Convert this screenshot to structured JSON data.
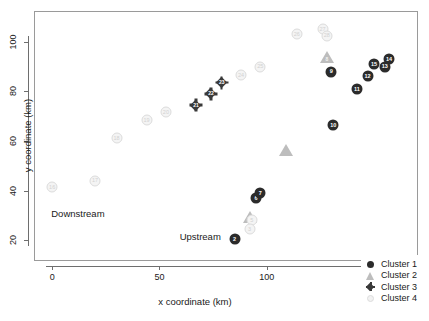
{
  "title": "",
  "chart_data": {
    "type": "scatter",
    "title": "",
    "xlabel": "x coordinate (km)",
    "ylabel": "y coordinate (km)",
    "xlim": [
      -8,
      170
    ],
    "ylim": [
      12,
      112
    ],
    "xticks": [
      0,
      50,
      100,
      150
    ],
    "yticks": [
      20,
      40,
      60,
      80,
      100
    ],
    "grid": false,
    "legend_position": "bottom-right",
    "legend": [
      "Cluster 1",
      "Cluster 2",
      "Cluster 3",
      "Cluster 4"
    ],
    "annotations": [
      {
        "text": "Downstream",
        "x": 12,
        "y": 31
      },
      {
        "text": "Upstream",
        "x": 69,
        "y": 21.5
      }
    ],
    "series": [
      {
        "name": "Cluster 1",
        "marker": "filled-circle",
        "color": "#2b2b2b",
        "points": [
          {
            "label": "2",
            "x": 85,
            "y": 20.5
          },
          {
            "label": "6",
            "x": 95,
            "y": 37.0
          },
          {
            "label": "7",
            "x": 97,
            "y": 39.0
          },
          {
            "label": "9",
            "x": 130,
            "y": 88.0
          },
          {
            "label": "10",
            "x": 131,
            "y": 66.5
          },
          {
            "label": "11",
            "x": 142,
            "y": 81.0
          },
          {
            "label": "12",
            "x": 147,
            "y": 86.0
          },
          {
            "label": "15",
            "x": 150,
            "y": 91.0
          },
          {
            "label": "13",
            "x": 155,
            "y": 90.0
          },
          {
            "label": "14",
            "x": 157,
            "y": 93.0
          }
        ]
      },
      {
        "name": "Cluster 2",
        "marker": "filled-triangle",
        "color": "#bdbdbd",
        "points": [
          {
            "label": "4",
            "x": 92,
            "y": 29.5
          },
          {
            "label": "",
            "x": 109,
            "y": 56.5
          },
          {
            "label": "8",
            "x": 128,
            "y": 94.0
          }
        ]
      },
      {
        "name": "Cluster 3",
        "marker": "filled-diamond",
        "color": "#3a3a3a",
        "points": [
          {
            "label": "21",
            "x": 67,
            "y": 74.5
          },
          {
            "label": "22",
            "x": 74,
            "y": 79.0
          },
          {
            "label": "23",
            "x": 79,
            "y": 83.5
          }
        ]
      },
      {
        "name": "Cluster 4",
        "marker": "open-circle",
        "color": "#f4f4f4",
        "points": [
          {
            "label": "16",
            "x": 0,
            "y": 41.5
          },
          {
            "label": "17",
            "x": 20,
            "y": 44.0
          },
          {
            "label": "18",
            "x": 30,
            "y": 61.0
          },
          {
            "label": "19",
            "x": 44,
            "y": 68.5
          },
          {
            "label": "20",
            "x": 53,
            "y": 71.5
          },
          {
            "label": "24",
            "x": 88,
            "y": 86.5
          },
          {
            "label": "25",
            "x": 97,
            "y": 90.0
          },
          {
            "label": "26",
            "x": 114,
            "y": 103.0
          },
          {
            "label": "27",
            "x": 126,
            "y": 105.0
          },
          {
            "label": "28",
            "x": 128,
            "y": 102.5
          },
          {
            "label": "5",
            "x": 93,
            "y": 28.0
          },
          {
            "label": "3",
            "x": 92,
            "y": 24.5
          }
        ]
      }
    ]
  }
}
